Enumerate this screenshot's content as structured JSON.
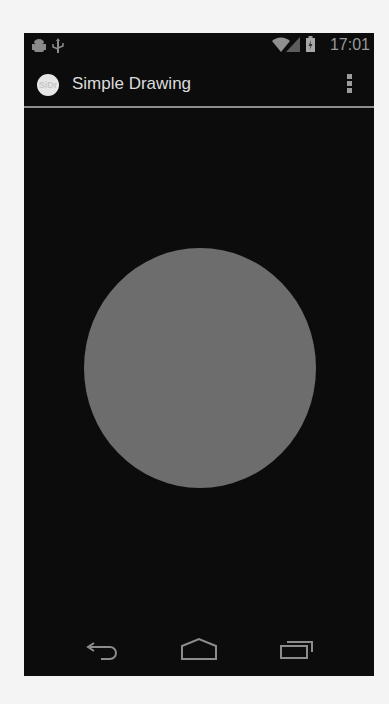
{
  "status_bar": {
    "left_icons": [
      "android-debug-icon",
      "usb-icon"
    ],
    "right_icons": [
      "wifi-icon",
      "signal-icon",
      "battery-charging-icon"
    ],
    "time": "17:01"
  },
  "action_bar": {
    "app_icon_text": "SiDr",
    "title": "Simple Drawing",
    "overflow_icon": "overflow-menu-icon"
  },
  "canvas": {
    "background": "#0c0c0c",
    "shapes": [
      {
        "type": "circle",
        "color": "#6d6d6d",
        "cx": 199,
        "cy": 367,
        "diameter": 232
      }
    ]
  },
  "nav_bar": {
    "buttons": [
      {
        "name": "back",
        "icon": "back-icon"
      },
      {
        "name": "home",
        "icon": "home-icon"
      },
      {
        "name": "recents",
        "icon": "recents-icon"
      }
    ]
  }
}
